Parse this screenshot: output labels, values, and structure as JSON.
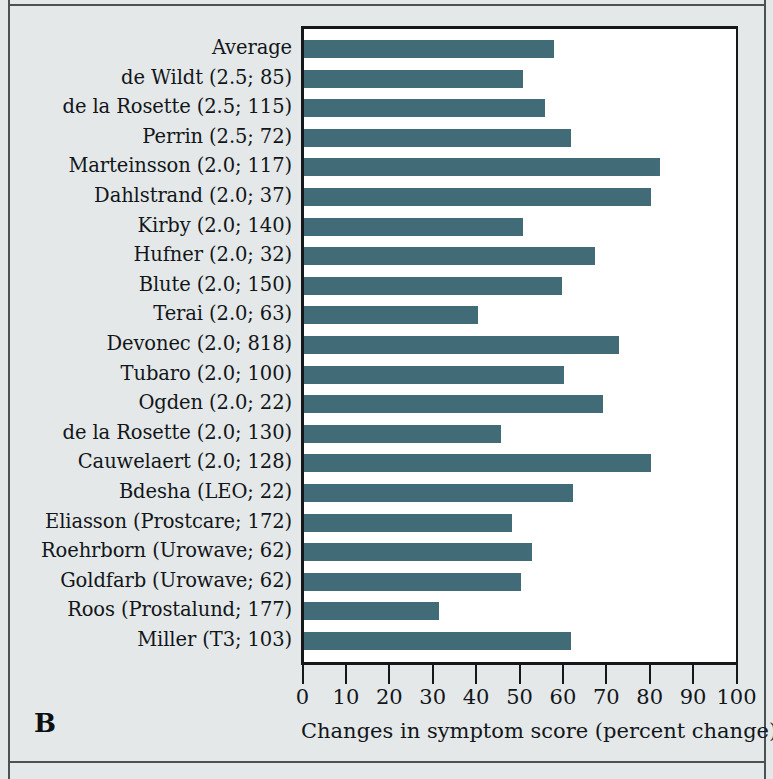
{
  "panel": {
    "letter": "B"
  },
  "chart_data": {
    "type": "bar",
    "orientation": "horizontal",
    "title": "",
    "xlabel": "Changes in symptom score (percent change)",
    "ylabel": "",
    "xlim": [
      0,
      100
    ],
    "xticks": [
      0,
      10,
      20,
      30,
      40,
      50,
      60,
      70,
      80,
      90,
      100
    ],
    "xtick_labels": [
      "0",
      "10",
      "20",
      "30",
      "40",
      "50",
      "60",
      "70",
      "80",
      "90",
      "100"
    ],
    "grid": false,
    "legend": false,
    "bar_color": "#426b78",
    "plot_bg": "#ffffff",
    "figure_bg": "#e4e8e8",
    "categories": [
      "Average",
      "de Wildt (2.5; 85)",
      "de la Rosette (2.5; 115)",
      "Perrin (2.5; 72)",
      "Marteinsson (2.0; 117)",
      "Dahlstrand (2.0; 37)",
      "Kirby (2.0; 140)",
      "Hufner (2.0; 32)",
      "Blute (2.0; 150)",
      "Terai (2.0; 63)",
      "Devonec (2.0; 818)",
      "Tubaro (2.0; 100)",
      "Ogden (2.0; 22)",
      "de la Rosette (2.0; 130)",
      "Cauwelaert (2.0; 128)",
      "Bdesha (LEO; 22)",
      "Eliasson (Prostcare; 172)",
      "Roehrborn (Urowave; 62)",
      "Goldfarb (Urowave; 62)",
      "Roos (Prostalund; 177)",
      "Miller (T3; 103)"
    ],
    "values": [
      57.5,
      50.5,
      55.5,
      61.5,
      82,
      80,
      50.5,
      67,
      59.5,
      40,
      72.5,
      60,
      69,
      45.5,
      80,
      62,
      48,
      52.5,
      50,
      31,
      61.5
    ]
  }
}
